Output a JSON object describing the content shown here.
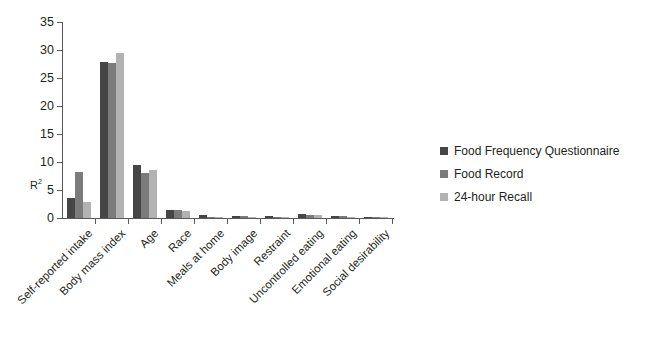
{
  "chart_data": {
    "type": "bar",
    "title": "",
    "subtitle": "",
    "xlabel": "",
    "ylabel": "R²",
    "ylim": [
      0,
      35
    ],
    "ytick_step": 5,
    "yticks": [
      "35",
      "30",
      "25",
      "20",
      "15",
      "10",
      "5",
      "0"
    ],
    "grid": false,
    "legend_position": "right",
    "categories": [
      "Self-reported intake",
      "Body mass index",
      "Age",
      "Race",
      "Meals at home",
      "Body image",
      "Restraint",
      "Uncontrolled eating",
      "Emotional eating",
      "Social desirability"
    ],
    "series": [
      {
        "name": "Food Frequency Questionnaire",
        "color": "#464646",
        "values": [
          3.6,
          27.8,
          9.4,
          1.4,
          0.5,
          0.3,
          0.3,
          0.8,
          0.3,
          0.05
        ]
      },
      {
        "name": "Food Record",
        "color": "#7b7b7b",
        "values": [
          8.3,
          27.6,
          8.1,
          1.4,
          0.2,
          0.3,
          0.2,
          0.6,
          0.3,
          0.05
        ]
      },
      {
        "name": "24-hour Recall",
        "color": "#b2b2b2",
        "values": [
          2.9,
          29.4,
          8.6,
          1.3,
          0.2,
          0.2,
          0.2,
          0.6,
          0.1,
          0.05
        ]
      }
    ]
  },
  "legend": {
    "items": [
      {
        "label": "Food Frequency Questionnaire",
        "color": "#464646"
      },
      {
        "label": "Food Record",
        "color": "#7b7b7b"
      },
      {
        "label": "24-hour Recall",
        "color": "#b2b2b2"
      }
    ]
  },
  "axes": {
    "y_title": "R",
    "y_title_sup": "2"
  }
}
